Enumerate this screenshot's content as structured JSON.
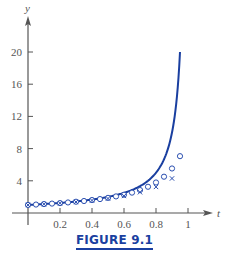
{
  "caption": "FIGURE 9.1",
  "colors": {
    "axis": "#555555",
    "curve": "#1a3fa0",
    "markers": "#2b4fb0",
    "caption": "#1a3fa0"
  },
  "chart_data": {
    "type": "line",
    "title": "",
    "xlabel": "t",
    "ylabel": "y",
    "xlim": [
      0,
      1.05
    ],
    "ylim": [
      0,
      22
    ],
    "grid": false,
    "legend": "none",
    "x_ticks": [
      "0.2",
      "0.4",
      "0.6",
      "0.8",
      "1"
    ],
    "y_ticks": [
      "4",
      "8",
      "12",
      "16",
      "20"
    ],
    "series": [
      {
        "name": "exact solution (solid curve)",
        "style": "line",
        "x": [
          0,
          0.1,
          0.2,
          0.3,
          0.4,
          0.5,
          0.6,
          0.7,
          0.75,
          0.8,
          0.85,
          0.88,
          0.9,
          0.92,
          0.93,
          0.94,
          0.95
        ],
        "values": [
          1,
          1.11,
          1.25,
          1.43,
          1.67,
          2.0,
          2.5,
          3.33,
          4.0,
          5.0,
          6.67,
          8.33,
          10.0,
          12.5,
          14.29,
          16.67,
          20.0
        ]
      },
      {
        "name": "approximation h=0.05 (circles)",
        "style": "circle",
        "x": [
          0,
          0.05,
          0.1,
          0.15,
          0.2,
          0.25,
          0.3,
          0.35,
          0.4,
          0.45,
          0.5,
          0.55,
          0.6,
          0.65,
          0.7,
          0.75,
          0.8,
          0.85,
          0.9,
          0.95
        ],
        "values": [
          1.0,
          1.05,
          1.11,
          1.17,
          1.23,
          1.31,
          1.4,
          1.49,
          1.61,
          1.73,
          1.88,
          2.06,
          2.27,
          2.53,
          2.85,
          3.26,
          3.79,
          4.51,
          5.53,
          7.06
        ]
      },
      {
        "name": "approximation h=0.1 (crosses)",
        "style": "cross",
        "x": [
          0,
          0.1,
          0.2,
          0.3,
          0.4,
          0.5,
          0.6,
          0.7,
          0.8,
          0.9
        ],
        "values": [
          1.0,
          1.1,
          1.22,
          1.37,
          1.56,
          1.8,
          2.12,
          2.58,
          3.24,
          4.29
        ]
      }
    ]
  }
}
